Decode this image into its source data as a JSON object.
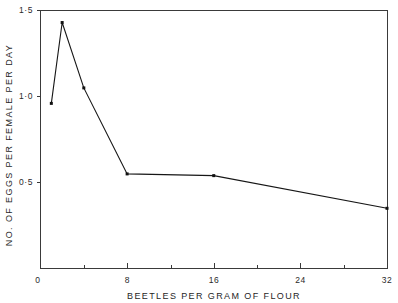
{
  "chart_data": {
    "type": "line",
    "title": "",
    "xlabel": "BEETLES PER GRAM OF FLOUR",
    "ylabel": "NO. OF EGGS PER FEMALE PER DAY",
    "x": [
      1,
      2,
      4,
      8,
      16,
      32
    ],
    "values": [
      0.96,
      1.43,
      1.05,
      0.55,
      0.54,
      0.35
    ],
    "series": [
      {
        "name": "eggs per female per day",
        "x": [
          1,
          2,
          4,
          8,
          16,
          32
        ],
        "values": [
          0.96,
          1.43,
          1.05,
          0.55,
          0.54,
          0.35
        ]
      }
    ],
    "xlim": [
      0,
      32
    ],
    "ylim": [
      0,
      1.5
    ],
    "grid": false,
    "legend": false,
    "legend_position": "none",
    "x_major_ticks": [
      0,
      8,
      16,
      24,
      32
    ],
    "x_major_tick_labels": [
      "0",
      "8",
      "16",
      "24",
      "32"
    ],
    "x_minor_ticks": [
      4,
      12,
      20,
      28
    ],
    "y_major_ticks": [
      0.5,
      1.0,
      1.5
    ],
    "y_major_tick_labels": [
      "0·5",
      "1·0",
      "1·5"
    ],
    "y_origin_label": "0",
    "marker": "square-dot",
    "line_color": "#161616",
    "marker_color": "#111111",
    "axis_color": "#3a3a3a",
    "background_color": "#ffffff"
  },
  "axes": {
    "x_title": "BEETLES PER GRAM OF FLOUR",
    "y_title": "NO. OF EGGS PER FEMALE PER DAY"
  }
}
